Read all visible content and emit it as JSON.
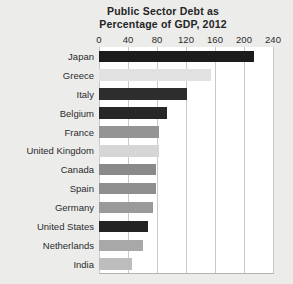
{
  "chart_data": {
    "type": "bar",
    "orientation": "horizontal",
    "title": "Public Sector Debt as Percentage of GDP, 2012",
    "title_lines": [
      "Public Sector Debt as",
      "Percentage of GDP, 2012"
    ],
    "xlabel": "",
    "ylabel": "",
    "xlim": [
      0,
      240
    ],
    "xticks": [
      0,
      40,
      80,
      120,
      160,
      200,
      240
    ],
    "xtick_labels": [
      "0",
      "40",
      "80",
      "120",
      "160",
      "200",
      "240"
    ],
    "grid": "vertical",
    "legend": "none",
    "categories": [
      "Japan",
      "Greece",
      "Italy",
      "Belgium",
      "France",
      "United Kingdom",
      "Canada",
      "Spain",
      "Germany",
      "United States",
      "Netherlands",
      "India"
    ],
    "values": [
      214,
      155,
      121,
      94,
      83,
      83,
      79,
      79,
      75,
      68,
      61,
      46
    ],
    "bar_colors": [
      "#1c1c1c",
      "#e2e2e2",
      "#2d2d2d",
      "#272727",
      "#949494",
      "#d6d6d6",
      "#8a8a8a",
      "#8f8f8f",
      "#9a9a9a",
      "#232323",
      "#a8a8a8",
      "#bdbdbd"
    ],
    "bars": [
      {
        "label": "Japan",
        "value": 214,
        "color": "#1c1c1c"
      },
      {
        "label": "Greece",
        "value": 155,
        "color": "#e2e2e2"
      },
      {
        "label": "Italy",
        "value": 121,
        "color": "#2d2d2d"
      },
      {
        "label": "Belgium",
        "value": 94,
        "color": "#272727"
      },
      {
        "label": "France",
        "value": 83,
        "color": "#949494"
      },
      {
        "label": "United Kingdom",
        "value": 83,
        "color": "#d6d6d6"
      },
      {
        "label": "Canada",
        "value": 79,
        "color": "#8a8a8a"
      },
      {
        "label": "Spain",
        "value": 79,
        "color": "#8f8f8f"
      },
      {
        "label": "Germany",
        "value": 75,
        "color": "#9a9a9a"
      },
      {
        "label": "United States",
        "value": 68,
        "color": "#232323"
      },
      {
        "label": "Netherlands",
        "value": 61,
        "color": "#a8a8a8"
      },
      {
        "label": "India",
        "value": 46,
        "color": "#bdbdbd"
      }
    ]
  },
  "style": {
    "page_background": "#ececeb",
    "plot_background": "#ffffff",
    "gridline_color": "#c9c9c9",
    "axis_line_color": "#b4b4b4",
    "text_color": "#2b2b2b"
  }
}
